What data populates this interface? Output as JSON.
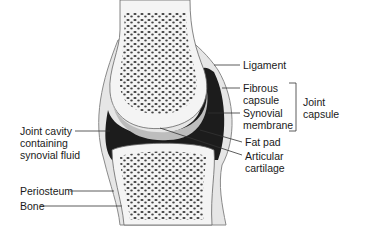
{
  "diagram": {
    "labels": {
      "ligament": "Ligament",
      "fibrous_capsule": "Fibrous\ncapsule",
      "synovial_membrane": "Synovial\nmembrane",
      "joint_capsule": "Joint\ncapsule",
      "fat_pad": "Fat pad",
      "articular_cartilage": "Articular\ncartilage",
      "joint_cavity": "Joint cavity\ncontaining\nsynovial fluid",
      "periosteum": "Periosteum",
      "bone": "Bone"
    },
    "colors": {
      "cavity": "#1c1c1c",
      "cartilage": "#bdbdbd",
      "bone_fill": "#f2f2f2",
      "spongy": "#3a3a3a",
      "capsule": "#9a9a9a",
      "leader": "#333333"
    }
  }
}
